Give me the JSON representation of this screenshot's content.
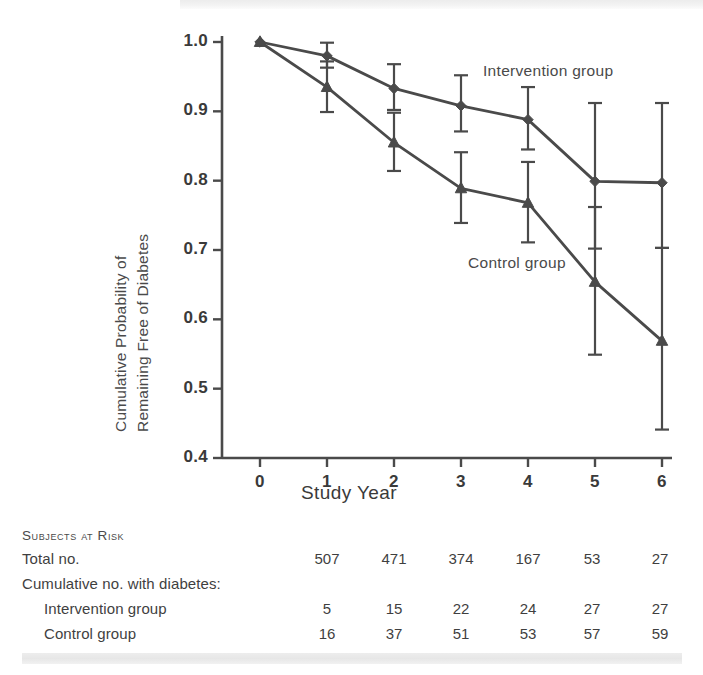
{
  "chart_data": {
    "type": "line",
    "title": "",
    "xlabel": "Study Year",
    "ylabel": "Cumulative Probability of Remaining Free of Diabetes",
    "ylabel_line1": "Cumulative Probability of",
    "ylabel_line2": "Remaining Free of Diabetes",
    "x": [
      0,
      1,
      2,
      3,
      4,
      5,
      6
    ],
    "xtick_labels": [
      "0",
      "1",
      "2",
      "3",
      "4",
      "5",
      "6"
    ],
    "ytick_labels": [
      "1.0",
      "0.9",
      "0.8",
      "0.7",
      "0.6",
      "0.5",
      "0.4"
    ],
    "ytick_values": [
      1.0,
      0.9,
      0.8,
      0.7,
      0.6,
      0.5,
      0.4
    ],
    "xlim": [
      0,
      6
    ],
    "ylim": [
      0.4,
      1.0
    ],
    "grid": false,
    "legend_position": "inline-annotation",
    "series": [
      {
        "name": "Intervention group",
        "marker": "diamond",
        "values": [
          1.0,
          0.98,
          0.933,
          0.908,
          0.888,
          0.799,
          0.797
        ],
        "error_low": [
          1.0,
          0.963,
          0.902,
          0.871,
          0.845,
          0.702,
          0.703
        ],
        "error_high": [
          1.0,
          0.999,
          0.968,
          0.952,
          0.935,
          0.912,
          0.912
        ]
      },
      {
        "name": "Control group",
        "marker": "triangle",
        "values": [
          1.0,
          0.935,
          0.855,
          0.789,
          0.768,
          0.654,
          0.569
        ],
        "error_low": [
          1.0,
          0.899,
          0.814,
          0.739,
          0.711,
          0.549,
          0.441
        ],
        "error_high": [
          1.0,
          0.972,
          0.898,
          0.841,
          0.827,
          0.762,
          0.703
        ]
      }
    ],
    "annotations": [
      {
        "text": "Intervention group",
        "x_px": 483,
        "y_px": 62
      },
      {
        "text": "Control group",
        "x_px": 468,
        "y_px": 254
      }
    ]
  },
  "risk_table": {
    "heading": "Subjects at Risk",
    "rows": [
      {
        "label": "Total no.",
        "indent": 0,
        "values": [
          "507",
          "471",
          "374",
          "167",
          "53",
          "27"
        ]
      },
      {
        "label": "Cumulative no. with diabetes:",
        "indent": 0,
        "values": [
          "",
          "",
          "",
          "",
          "",
          ""
        ]
      },
      {
        "label": "Intervention group",
        "indent": 1,
        "values": [
          "5",
          "15",
          "22",
          "24",
          "27",
          "27"
        ]
      },
      {
        "label": "Control group",
        "indent": 1,
        "values": [
          "16",
          "37",
          "51",
          "53",
          "57",
          "59"
        ]
      }
    ]
  },
  "style": {
    "ink": "#4a4a4a",
    "text": "#3b3b3b",
    "background": "#ffffff"
  }
}
